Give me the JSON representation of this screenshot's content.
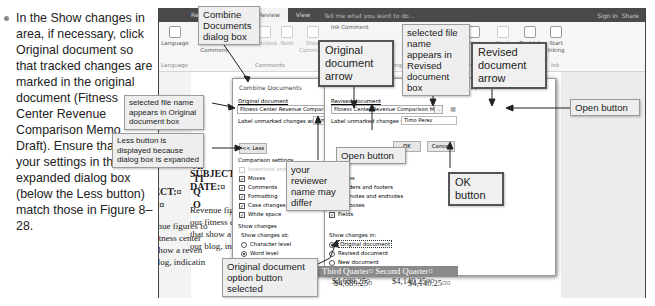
{
  "step_text": "In the Show changes in area, if necessary, click Original document so that tracked changes are marked in the original document (Fitness Center Revenue Comparison Memo Draft). Ensure that all your settings in the expanded dialog box (below the Less button) match those in Figure 8–28.",
  "titlebar": {
    "tabs": [
      "Refe",
      "Review",
      "View"
    ],
    "active_tab": "Review",
    "tell_me": "Tell me what you want to do...",
    "sign_in": "Sign in",
    "share": "Share"
  },
  "ribbon": {
    "language": "Language",
    "new_comment": "New Comment",
    "delete": "Delete",
    "previous": "Previous",
    "next": "Next",
    "show_comments": "Show Comments",
    "ink_comment": "Ink Comment",
    "previous_change": "Previous",
    "compare": "Compare",
    "block_authors": "Block Authors",
    "restrict_editing": "Restrict Editing",
    "start_inking": "Start Inking",
    "groups": {
      "language": "Language",
      "comments": "Comments",
      "tracking": "Tracking",
      "changes": "Changes",
      "compare": "Compare",
      "protect": "Protect",
      "ink": "Ink"
    }
  },
  "memo": {
    "subject_label": "SUBJECT:¤",
    "date_label": "DATE:¤",
    "row_a": "Al",
    "row_t": "TI",
    "row_q": "Q",
    "row_o": "O",
    "body_lines": [
      "Revenue figures fo",
      "our fitness center",
      "that show a reven",
      "our blog, indicatin"
    ],
    "table_header": "Third Quarter¤  Second Quarter¤",
    "table_values": [
      "$4,689.25¤",
      "$4,140.25¤¤"
    ]
  },
  "dialog": {
    "title": "Combine Documents",
    "help": "?",
    "close": "×",
    "original_label": "Original document",
    "original_value": "Fitness Center Revenue Comparison Memo Dr",
    "revised_label": "Revised document",
    "revised_value": "Fitness Center Revenue Comparison Memo wi",
    "label_changes": "Label unmarked changes with:",
    "original_reviewer": "Timo Perez",
    "revised_reviewer": "Timo Perez",
    "less_button": "<< Less",
    "ok_button": "OK",
    "cancel_button": "Cancel",
    "comparison_settings": "Comparison settings",
    "insertions_deletions": "Insertions and deletions",
    "left_checks": [
      "Moves",
      "Comments",
      "Formatting",
      "Case changes",
      "White space"
    ],
    "right_checks": [
      "Tables",
      "Headers and footers",
      "Footnotes and endnotes",
      "Textboxes",
      "Fields"
    ],
    "show_changes": "Show changes",
    "show_changes_at": "Show changes at:",
    "level_options": [
      "Character level",
      "Word level"
    ],
    "selected_level": "Word level",
    "show_changes_in": "Show changes in:",
    "in_options": [
      "Original document",
      "Revised document",
      "New document"
    ],
    "selected_in": "Original document"
  },
  "callouts": {
    "combine_dialog": "Combine Documents dialog box",
    "original_arrow": "Original document arrow",
    "selected_revised": "selected file name appears in Revised document box",
    "revised_arrow": "Revised document arrow",
    "open_button_right": "Open button",
    "selected_original": "selected file name appears in Original document box",
    "less_button": "Less button is displayed because dialog box is expanded",
    "open_button_mid": "Open button",
    "reviewer": "your reviewer name may differ",
    "ok_button": "OK button",
    "original_option": "Original document option button selected"
  }
}
